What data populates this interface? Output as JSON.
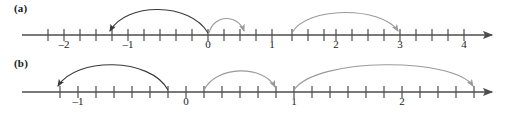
{
  "figure": {
    "type": "number-line-diagram",
    "line_color": "#4d4d4d",
    "arc_dark_color": "#3a3a3a",
    "arc_light_color": "#9a9a9a",
    "text_color": "#1a1a1a",
    "background": "#ffffff"
  },
  "panels": [
    {
      "id": "a",
      "label": "(a)",
      "axis": {
        "y": 35,
        "x_start": 22,
        "x_end": 496,
        "origin_px": 208,
        "unit_px": 64,
        "tick_step_units": 0.25,
        "tick_step_px": 16,
        "arrow_right": true
      },
      "ticks": [
        {
          "value": -2.5,
          "x": 48,
          "label": ""
        },
        {
          "value": -2,
          "x": 64,
          "label": "–2"
        },
        {
          "value": -1.75,
          "x": 80,
          "label": ""
        },
        {
          "value": -1.5,
          "x": 96,
          "label": ""
        },
        {
          "value": -1.25,
          "x": 112,
          "label": ""
        },
        {
          "value": -1,
          "x": 128,
          "label": "–1"
        },
        {
          "value": -0.75,
          "x": 144,
          "label": ""
        },
        {
          "value": -0.5,
          "x": 160,
          "label": ""
        },
        {
          "value": -0.25,
          "x": 176,
          "label": ""
        },
        {
          "value": 0,
          "x": 208,
          "label": "0"
        },
        {
          "value": 0.25,
          "x": 224,
          "label": ""
        },
        {
          "value": 0.5,
          "x": 240,
          "label": ""
        },
        {
          "value": 0.75,
          "x": 256,
          "label": ""
        },
        {
          "value": 1,
          "x": 272,
          "label": "1"
        },
        {
          "value": 1.25,
          "x": 292,
          "label": ""
        },
        {
          "value": 1.5,
          "x": 308,
          "label": ""
        },
        {
          "value": 1.75,
          "x": 324,
          "label": ""
        },
        {
          "value": 2,
          "x": 336,
          "label": "2"
        },
        {
          "value": 2.25,
          "x": 352,
          "label": ""
        },
        {
          "value": 2.5,
          "x": 368,
          "label": ""
        },
        {
          "value": 2.75,
          "x": 384,
          "label": ""
        },
        {
          "value": 3,
          "x": 400,
          "label": "3"
        },
        {
          "value": 3.25,
          "x": 416,
          "label": ""
        },
        {
          "value": 3.5,
          "x": 432,
          "label": ""
        },
        {
          "value": 3.75,
          "x": 448,
          "label": ""
        },
        {
          "value": 4,
          "x": 464,
          "label": "4"
        }
      ],
      "tick_labels": [
        {
          "text": "–2",
          "x": 64
        },
        {
          "text": "–1",
          "x": 128
        },
        {
          "text": "0",
          "x": 208
        },
        {
          "text": "1",
          "x": 272
        },
        {
          "text": "2",
          "x": 336
        },
        {
          "text": "3",
          "x": 400
        },
        {
          "text": "4",
          "x": 464
        }
      ],
      "arcs": [
        {
          "name": "arc-a-1",
          "from_x": 208,
          "to_x": 108,
          "height": 26,
          "direction": "left",
          "color": "dark"
        },
        {
          "name": "arc-a-2",
          "from_x": 208,
          "to_x": 246,
          "height": 16,
          "direction": "right",
          "color": "light"
        },
        {
          "name": "arc-a-3",
          "from_x": 292,
          "to_x": 400,
          "height": 24,
          "direction": "right",
          "color": "light"
        }
      ]
    },
    {
      "id": "b",
      "label": "(b)",
      "axis": {
        "y": 37,
        "x_start": 22,
        "x_end": 496,
        "origin_px": 186,
        "unit_px": 108,
        "tick_step_units": 0.16667,
        "tick_step_px": 18,
        "arrow_right": true
      },
      "ticks": [
        {
          "value": -1.16667,
          "x": 60,
          "label": ""
        },
        {
          "value": -1,
          "x": 78,
          "label": "–1"
        },
        {
          "value": -0.83333,
          "x": 96,
          "label": ""
        },
        {
          "value": -0.66667,
          "x": 114,
          "label": ""
        },
        {
          "value": -0.5,
          "x": 132,
          "label": ""
        },
        {
          "value": -0.33333,
          "x": 150,
          "label": ""
        },
        {
          "value": -0.16667,
          "x": 168,
          "label": ""
        },
        {
          "value": 0,
          "x": 186,
          "label": "0"
        },
        {
          "value": 0.16667,
          "x": 204,
          "label": ""
        },
        {
          "value": 0.33333,
          "x": 222,
          "label": ""
        },
        {
          "value": 0.5,
          "x": 240,
          "label": ""
        },
        {
          "value": 0.66667,
          "x": 258,
          "label": ""
        },
        {
          "value": 0.83333,
          "x": 276,
          "label": ""
        },
        {
          "value": 1,
          "x": 294,
          "label": "1"
        },
        {
          "value": 1.16667,
          "x": 312,
          "label": ""
        },
        {
          "value": 1.33333,
          "x": 330,
          "label": ""
        },
        {
          "value": 1.5,
          "x": 348,
          "label": ""
        },
        {
          "value": 1.66667,
          "x": 366,
          "label": ""
        },
        {
          "value": 1.83333,
          "x": 384,
          "label": ""
        },
        {
          "value": 2,
          "x": 402,
          "label": "2"
        },
        {
          "value": 2.16667,
          "x": 420,
          "label": ""
        },
        {
          "value": 2.33333,
          "x": 438,
          "label": ""
        },
        {
          "value": 2.5,
          "x": 456,
          "label": ""
        },
        {
          "value": 2.66667,
          "x": 474,
          "label": ""
        }
      ],
      "tick_labels": [
        {
          "text": "–1",
          "x": 78
        },
        {
          "text": "0",
          "x": 186
        },
        {
          "text": "1",
          "x": 294
        },
        {
          "text": "2",
          "x": 402
        }
      ],
      "arcs": [
        {
          "name": "arc-b-1",
          "from_x": 168,
          "to_x": 56,
          "height": 27,
          "direction": "left",
          "color": "dark"
        },
        {
          "name": "arc-b-2",
          "from_x": 204,
          "to_x": 276,
          "height": 20,
          "direction": "right",
          "color": "light"
        },
        {
          "name": "arc-b-3",
          "from_x": 294,
          "to_x": 474,
          "height": 27,
          "direction": "right",
          "color": "light"
        }
      ]
    }
  ]
}
